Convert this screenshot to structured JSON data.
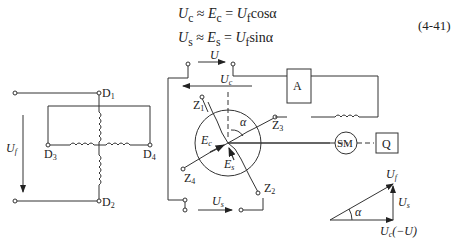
{
  "equations": {
    "line1": "U_c ≈ E_c = U_f cosα",
    "line1_parts": {
      "lhs": "U",
      "lhs_sub": "c",
      "mid": "E",
      "mid_sub": "c",
      "rhs": "U",
      "rhs_sub": "f",
      "fn": "cosα"
    },
    "line2": "U_s ≈ E_s = U_f sinα",
    "line2_parts": {
      "lhs": "U",
      "lhs_sub": "s",
      "mid": "E",
      "mid_sub": "s",
      "rhs": "U",
      "rhs_sub": "f",
      "fn": "sinα"
    },
    "number": "(4-41)"
  },
  "stator": {
    "terminals": [
      "D1",
      "D2",
      "D3",
      "D4"
    ],
    "voltage_label": "U_f"
  },
  "rotor": {
    "terminals": [
      "Z1",
      "Z2",
      "Z3",
      "Z4"
    ],
    "emf_labels": [
      "E_c",
      "E_s"
    ],
    "angle_label": "α",
    "top_voltage": "U",
    "cos_voltage": "U_c",
    "sin_voltage": "U_s"
  },
  "blocks": {
    "amplifier": "A",
    "servo_motor": "SM",
    "load": "Q"
  },
  "phasor": {
    "hypotenuse": "U_f",
    "vertical": "U_s",
    "horizontal": "U_c(−U)",
    "angle": "α"
  }
}
